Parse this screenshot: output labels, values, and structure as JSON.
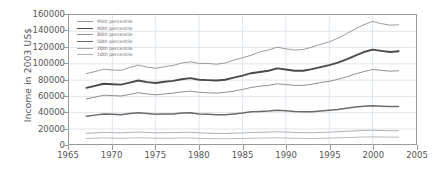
{
  "chart_data": {
    "type": "line",
    "title": "",
    "xlabel": "",
    "ylabel": "Income in 2003 US$",
    "xlim": [
      1965,
      2005
    ],
    "ylim": [
      0,
      160000
    ],
    "xticks": [
      1965,
      1970,
      1975,
      1980,
      1985,
      1990,
      1995,
      2000,
      2005
    ],
    "yticks": [
      0,
      20000,
      40000,
      60000,
      80000,
      100000,
      120000,
      140000,
      160000
    ],
    "grid": true,
    "legend_position": "top-left",
    "x": [
      1967,
      1968,
      1969,
      1970,
      1971,
      1972,
      1973,
      1974,
      1975,
      1976,
      1977,
      1978,
      1979,
      1980,
      1981,
      1982,
      1983,
      1984,
      1985,
      1986,
      1987,
      1988,
      1989,
      1990,
      1991,
      1992,
      1993,
      1994,
      1995,
      1996,
      1997,
      1998,
      1999,
      2000,
      2001,
      2002,
      2003
    ],
    "series": [
      {
        "name": "95th percentile",
        "color": "#9a9a9a",
        "width": 1.0,
        "values": [
          88000,
          90500,
          93500,
          92500,
          92000,
          95500,
          98500,
          96000,
          94500,
          96500,
          98000,
          101000,
          102500,
          100500,
          100500,
          99500,
          101000,
          104500,
          107500,
          110500,
          114500,
          117000,
          120500,
          118500,
          117000,
          117500,
          120500,
          124000,
          127000,
          131500,
          137000,
          143000,
          148000,
          152000,
          149500,
          147500,
          148000
        ]
      },
      {
        "name": "90th percentile",
        "color": "#4a4a4a",
        "width": 1.9,
        "values": [
          70500,
          73000,
          75500,
          75000,
          74500,
          77000,
          79500,
          77500,
          76500,
          78000,
          79000,
          81000,
          82500,
          80500,
          80000,
          79500,
          80500,
          83000,
          85500,
          88500,
          90000,
          91500,
          94500,
          93000,
          91500,
          91500,
          93500,
          96000,
          98500,
          101500,
          105500,
          110000,
          114500,
          117500,
          116000,
          114500,
          115500
        ]
      },
      {
        "name": "80th percentile",
        "color": "#8e8e8e",
        "width": 1.0,
        "values": [
          57000,
          59000,
          61500,
          61000,
          60500,
          62500,
          64500,
          63000,
          62000,
          63000,
          64000,
          65500,
          66500,
          65000,
          64500,
          64000,
          65000,
          66500,
          68500,
          71000,
          72500,
          73500,
          75500,
          74500,
          73500,
          73500,
          75000,
          77000,
          78500,
          81000,
          84000,
          87500,
          90500,
          93000,
          92000,
          91000,
          91500
        ]
      },
      {
        "name": "50th percentile",
        "color": "#6b6b6b",
        "width": 1.5,
        "values": [
          35500,
          37000,
          38500,
          38000,
          37500,
          39000,
          40000,
          39000,
          38000,
          38500,
          38500,
          39500,
          40000,
          38500,
          38000,
          37500,
          37500,
          38500,
          39500,
          41000,
          41500,
          42000,
          43000,
          42500,
          41500,
          41000,
          41000,
          42000,
          43000,
          44000,
          45500,
          47000,
          48000,
          48500,
          48000,
          47500,
          47500
        ]
      },
      {
        "name": "20th percentile",
        "color": "#a5a5a5",
        "width": 0.9,
        "values": [
          14500,
          15200,
          15800,
          15500,
          15200,
          15800,
          16200,
          15800,
          15200,
          15400,
          15500,
          15800,
          16000,
          15200,
          14800,
          14500,
          14400,
          14800,
          15100,
          15600,
          15900,
          16100,
          16500,
          16200,
          15700,
          15500,
          15300,
          15600,
          16100,
          16600,
          17100,
          17700,
          18200,
          18400,
          18100,
          17800,
          17800
        ]
      },
      {
        "name": "10th percentile",
        "color": "#b0b0b0",
        "width": 0.9,
        "values": [
          8200,
          8600,
          9000,
          8800,
          8600,
          8900,
          9200,
          8900,
          8600,
          8700,
          8700,
          8900,
          9000,
          8500,
          8200,
          8000,
          7900,
          8100,
          8300,
          8600,
          8800,
          8900,
          9100,
          8900,
          8600,
          8400,
          8300,
          8500,
          8800,
          9100,
          9400,
          9800,
          10100,
          10300,
          10100,
          9900,
          9900
        ]
      }
    ]
  }
}
